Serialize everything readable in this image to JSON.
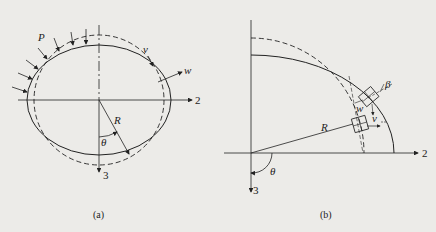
{
  "figure_a": {
    "caption": "(a)",
    "labels": {
      "load": "P",
      "tangential": "v",
      "radial": "w",
      "radius": "R",
      "angle": "θ",
      "axis_horizontal": "2",
      "axis_vertical": "3"
    }
  },
  "figure_b": {
    "caption": "(b)",
    "labels": {
      "rotation": "β",
      "radial": "w",
      "tangential": "v",
      "radius": "R",
      "angle": "θ",
      "axis_horizontal": "2",
      "axis_vertical": "3"
    }
  },
  "colors": {
    "background": "#ecebe8",
    "ink": "#222222"
  }
}
